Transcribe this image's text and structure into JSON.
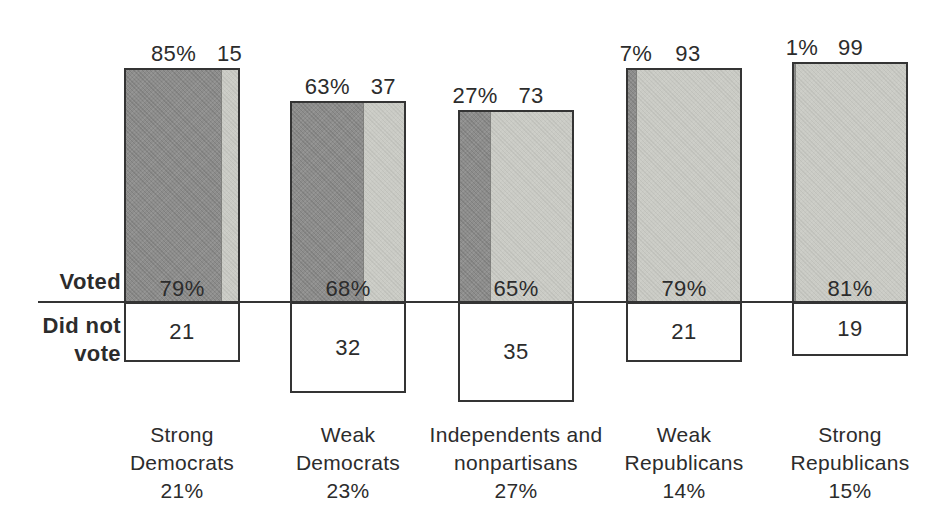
{
  "figure": {
    "background": "#ffffff",
    "text_color": "#2c2c2c",
    "dark_fill": "#8d8d8c",
    "light_fill": "#cacbc5",
    "border_color": "#343434"
  },
  "labels": {
    "voted": "Voted",
    "did_not_line1": "Did not",
    "did_not_line2": "vote"
  },
  "chart_data": {
    "type": "bar",
    "title": "",
    "unit": "percent",
    "legend_position": "none",
    "grid": false,
    "baseline_rows": {
      "above": "Voted",
      "below": "Did not vote"
    },
    "categories": [
      "Strong Democrats",
      "Weak Democrats",
      "Independents and nonpartisans",
      "Weak Republicans",
      "Strong Republicans"
    ],
    "share_of_sample": [
      "21%",
      "23%",
      "27%",
      "14%",
      "15%"
    ],
    "series": [
      {
        "name": "Voted Democratic (dark segment, % of two-party vote)",
        "values": [
          85,
          63,
          27,
          7,
          1
        ]
      },
      {
        "name": "Voted Republican (light segment, % of two-party vote)",
        "values": [
          15,
          37,
          73,
          93,
          99
        ]
      },
      {
        "name": "Voted (bar height above line, %)",
        "values": [
          79,
          68,
          65,
          79,
          81
        ]
      },
      {
        "name": "Did not vote (box depth below line, %)",
        "values": [
          21,
          32,
          35,
          21,
          19
        ]
      }
    ],
    "groups": [
      {
        "name_lines": [
          "Strong",
          "Democrats"
        ],
        "share_label": "21%",
        "dem_pct": 85,
        "dem_label": "85%",
        "rep_pct": 15,
        "rep_label": "15",
        "voted_pct": 79,
        "voted_label": "79%",
        "did_not_vote_pct": 21,
        "did_not_vote_label": "21"
      },
      {
        "name_lines": [
          "Weak",
          "Democrats"
        ],
        "share_label": "23%",
        "dem_pct": 63,
        "dem_label": "63%",
        "rep_pct": 37,
        "rep_label": "37",
        "voted_pct": 68,
        "voted_label": "68%",
        "did_not_vote_pct": 32,
        "did_not_vote_label": "32"
      },
      {
        "name_lines": [
          "Independents and",
          "nonpartisans"
        ],
        "share_label": "27%",
        "dem_pct": 27,
        "dem_label": "27%",
        "rep_pct": 73,
        "rep_label": "73",
        "voted_pct": 65,
        "voted_label": "65%",
        "did_not_vote_pct": 35,
        "did_not_vote_label": "35"
      },
      {
        "name_lines": [
          "Weak",
          "Republicans"
        ],
        "share_label": "14%",
        "dem_pct": 7,
        "dem_label": "7%",
        "rep_pct": 93,
        "rep_label": "93",
        "voted_pct": 79,
        "voted_label": "79%",
        "did_not_vote_pct": 21,
        "did_not_vote_label": "21"
      },
      {
        "name_lines": [
          "Strong",
          "Republicans"
        ],
        "share_label": "15%",
        "dem_pct": 1,
        "dem_label": "1%",
        "rep_pct": 99,
        "rep_label": "99",
        "voted_pct": 81,
        "voted_label": "81%",
        "did_not_vote_pct": 19,
        "did_not_vote_label": "19"
      }
    ]
  }
}
